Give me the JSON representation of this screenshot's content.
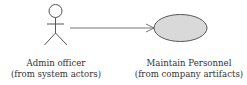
{
  "diagram": {
    "type": "uml-use-case",
    "actor": {
      "name": "Admin officer",
      "stereotype_note": "(from system actors)",
      "icon": "stick-figure-icon"
    },
    "use_case": {
      "name": "Maintain Personnel",
      "stereotype_note": "(from company artifacts)",
      "fill_color": "#d9d9d9",
      "stroke_color": "#555555"
    },
    "association": {
      "from": "Admin officer",
      "to": "Maintain Personnel",
      "style": "open-arrow",
      "color": "#777777"
    }
  }
}
